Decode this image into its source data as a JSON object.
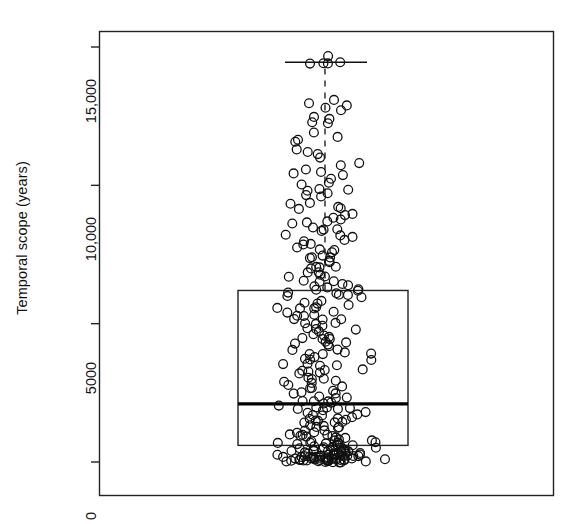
{
  "chart_data": {
    "type": "box",
    "title": "",
    "xlabel": "",
    "ylabel": "Temporal scope (years)",
    "ylim": [
      -300,
      15600
    ],
    "yticks": [
      0,
      5000,
      10000,
      15000
    ],
    "ytick_labels": [
      "0",
      "5000",
      "10,000",
      "15,000"
    ],
    "grid": false,
    "legend": null,
    "n_points": 300,
    "box": {
      "q1": 600,
      "median": 2100,
      "q3": 6200,
      "whisker_low": 0,
      "whisker_high": 14450,
      "label": ""
    },
    "overlay": {
      "style": "jittered open circles",
      "marker": "circle-open",
      "marker_size_px": 9,
      "stroke": "#111111"
    },
    "colors": {
      "frame": "#222222",
      "box_outline": "#222222",
      "median": "#000000",
      "whisker": "#111111",
      "point_stroke": "#111111",
      "background": "#ffffff"
    },
    "values": [
      14450,
      14420,
      14400,
      14380,
      14700,
      13100,
      12900,
      13000,
      12800,
      12700,
      12500,
      12300,
      12350,
      12250,
      11900,
      11700,
      11750,
      11550,
      11300,
      11200,
      11150,
      11000,
      10800,
      10700,
      10600,
      10500,
      10450,
      10350,
      10250,
      10100,
      10000,
      9900,
      9850,
      9800,
      9700,
      9600,
      9550,
      9400,
      9300,
      9250,
      9200,
      9100,
      9000,
      8950,
      8850,
      8800,
      8700,
      8650,
      8600,
      8500,
      8450,
      8400,
      8350,
      8250,
      8200,
      8100,
      8050,
      7950,
      7900,
      7850,
      7800,
      7700,
      7650,
      7600,
      7500,
      7450,
      7400,
      7350,
      7300,
      7250,
      7100,
      7050,
      7000,
      6950,
      6900,
      6800,
      6750,
      6700,
      6650,
      6600,
      6550,
      6500,
      6450,
      6400,
      6350,
      6300,
      6250,
      6200,
      6200,
      6150,
      6100,
      6050,
      6000,
      5950,
      5900,
      5850,
      5800,
      5750,
      5700,
      5650,
      5600,
      5550,
      5500,
      5450,
      5400,
      5350,
      5300,
      5250,
      5200,
      5150,
      5100,
      5050,
      5000,
      4950,
      4900,
      4850,
      4800,
      4750,
      4700,
      4650,
      4600,
      4550,
      4500,
      4450,
      4400,
      4350,
      4300,
      4250,
      4200,
      4150,
      4100,
      4050,
      4000,
      3950,
      3900,
      3850,
      3800,
      3750,
      3700,
      3650,
      3600,
      3550,
      3500,
      3450,
      3400,
      3350,
      3300,
      3250,
      3200,
      3150,
      3100,
      3050,
      3000,
      2950,
      2900,
      2850,
      2800,
      2750,
      2700,
      2650,
      2600,
      2550,
      2500,
      2450,
      2400,
      2350,
      2300,
      2250,
      2200,
      2150,
      2100,
      2100,
      2050,
      2000,
      1980,
      1950,
      1900,
      1880,
      1850,
      1800,
      1780,
      1750,
      1700,
      1680,
      1650,
      1600,
      1580,
      1550,
      1500,
      1480,
      1450,
      1400,
      1380,
      1350,
      1300,
      1280,
      1250,
      1200,
      1180,
      1150,
      1100,
      1080,
      1050,
      1000,
      980,
      950,
      920,
      900,
      880,
      850,
      830,
      800,
      780,
      760,
      740,
      720,
      700,
      690,
      680,
      660,
      640,
      620,
      600,
      590,
      580,
      560,
      540,
      520,
      500,
      490,
      480,
      460,
      450,
      440,
      430,
      420,
      400,
      390,
      380,
      370,
      360,
      350,
      340,
      330,
      320,
      310,
      300,
      295,
      290,
      280,
      270,
      260,
      250,
      245,
      240,
      230,
      220,
      210,
      200,
      195,
      190,
      180,
      175,
      170,
      160,
      155,
      150,
      145,
      140,
      135,
      130,
      125,
      120,
      115,
      110,
      105,
      100,
      95,
      90,
      85,
      80,
      75,
      70,
      65,
      60,
      55,
      50,
      45,
      40,
      38,
      35,
      32,
      30,
      28,
      25,
      22,
      20,
      18,
      15,
      10
    ]
  }
}
